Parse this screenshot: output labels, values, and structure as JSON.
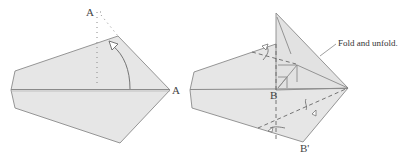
{
  "diagram": {
    "type": "origami-folding-steps",
    "colors": {
      "paper": "#e6e6e6",
      "edge": "#8a8a8a",
      "crease": "#7a7a7a",
      "valley_dashed": "#666666",
      "label": "#444444",
      "background": "#ffffff"
    },
    "steps": [
      {
        "id": "step-left",
        "labels": {
          "point_a_start": "A",
          "point_a_end": "A"
        },
        "instruction": "Fold point A up to the dotted line position (rotate flap upward)",
        "arrow": "curved-arrow-hollow-head"
      },
      {
        "id": "step-right",
        "labels": {
          "point_b": "B",
          "point_b_prime": "B'"
        },
        "caption": "Fold and unfold."
      }
    ]
  }
}
